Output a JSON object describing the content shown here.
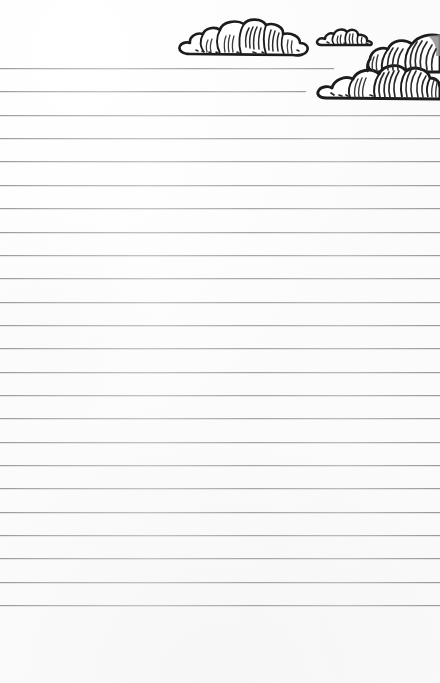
{
  "document": {
    "kind": "ruled-writing-paper",
    "title": "Lined Stationery Sheet with Cloud Illustration",
    "page_width": 440,
    "page_height": 683,
    "paper_color": "#fefefe",
    "text_content": "",
    "placeholder": ""
  },
  "rules": {
    "label": "Ruled writing lines",
    "count": 24,
    "first_line_y": 68,
    "spacing": 23.35,
    "color": "#a0a0a4",
    "thickness": 1,
    "short_lines": [
      {
        "index": 1,
        "y": 68,
        "width": 334
      },
      {
        "index": 2,
        "y": 91,
        "width": 306
      }
    ],
    "full_width": 440,
    "bottom_margin_y": 605
  },
  "illustration": {
    "label": "Hand-drawn ink clouds",
    "ink_color": "#1c1c1c",
    "shade_color": "#8c8c8c",
    "fill_color": "#ffffff",
    "clouds": [
      {
        "name": "cloud-medium-left",
        "x": 185,
        "y": 22,
        "width": 122,
        "height": 34
      },
      {
        "name": "cloud-small-center",
        "x": 318,
        "y": 28,
        "width": 55,
        "height": 19
      },
      {
        "name": "cloud-large-right",
        "x": 318,
        "y": 33,
        "width": 122,
        "height": 68
      }
    ]
  }
}
